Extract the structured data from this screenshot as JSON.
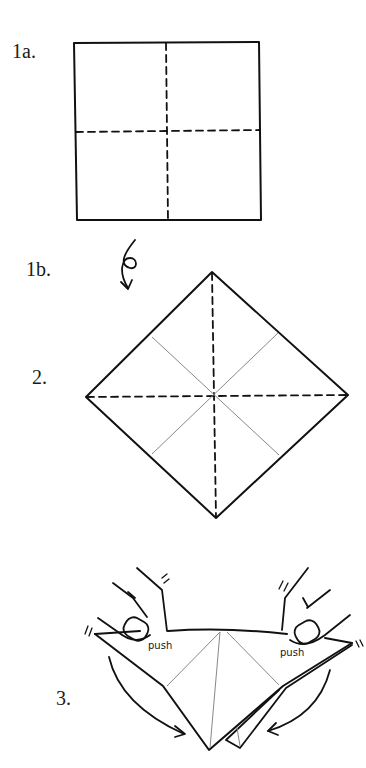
{
  "diagram": {
    "type": "origami-instructions",
    "steps": [
      {
        "id": "1a",
        "label": "1a.",
        "description": "Square with dashed valley folds, vertical and horizontal"
      },
      {
        "id": "1b",
        "label": "1b.",
        "description": "Flip-over arrow (turn paper over)"
      },
      {
        "id": "2",
        "label": "2.",
        "description": "Square rotated to diamond; dashed creases along diagonals, thin crease lines on the other diagonals"
      },
      {
        "id": "3",
        "label": "3.",
        "description": "Hands push both side corners; curved arrows show sides collapsing downward"
      }
    ],
    "annotations": {
      "push_left": "push",
      "push_right": "push"
    },
    "colors": {
      "line": "#111111",
      "thin_crease": "#888888",
      "background": "#ffffff"
    }
  }
}
